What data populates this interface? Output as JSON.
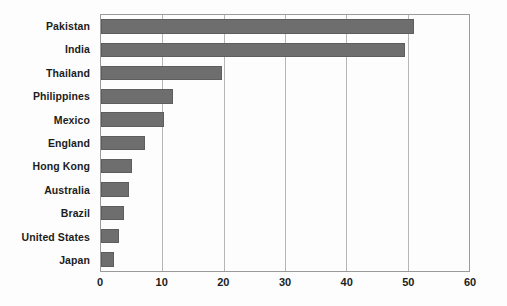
{
  "chart_data": {
    "type": "bar",
    "orientation": "horizontal",
    "title": "",
    "subtitle": "",
    "xlabel": "",
    "ylabel": "",
    "categories": [
      "Pakistan",
      "India",
      "Thailand",
      "Philippines",
      "Mexico",
      "England",
      "Hong Kong",
      "Australia",
      "Brazil",
      "United States",
      "Japan"
    ],
    "values": [
      51,
      49.5,
      19.7,
      11.8,
      10.3,
      7.2,
      5,
      4.6,
      3.7,
      3,
      2.2
    ],
    "series": [
      {
        "name": "",
        "values": [
          51,
          49.5,
          19.7,
          11.8,
          10.3,
          7.2,
          5,
          4.6,
          3.7,
          3,
          2.2
        ]
      }
    ],
    "xlim": [
      0,
      60
    ],
    "ylim": [
      0,
      11
    ],
    "xticks": [
      0,
      10,
      20,
      30,
      40,
      50,
      60
    ],
    "xtick_labels": [
      "0",
      "10",
      "20",
      "30",
      "40",
      "50",
      "60"
    ],
    "grid": "vertical",
    "legend": "none",
    "bar_color": "#6e6e6e",
    "gridline_color": "#b5b5b5",
    "axis_color": "#9a9a9a",
    "text_color": "#1c1c1c",
    "background_color": "#fdfdfd"
  }
}
